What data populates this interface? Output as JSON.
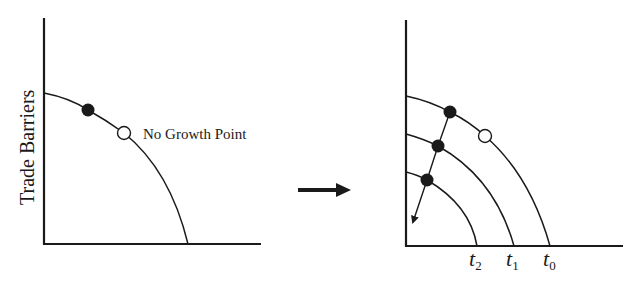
{
  "diagram": {
    "left_panel": {
      "y_axis_label": "Trade Barriers",
      "annotation": "No Growth Point",
      "points": [
        {
          "type": "filled",
          "label": "current point"
        },
        {
          "type": "open",
          "label": "No Growth Point"
        }
      ]
    },
    "transition_arrow": {
      "direction": "right"
    },
    "right_panel": {
      "curves": [
        {
          "label": "t",
          "sub": "0"
        },
        {
          "label": "t",
          "sub": "1"
        },
        {
          "label": "t",
          "sub": "2"
        }
      ],
      "points": [
        {
          "type": "filled",
          "curve": "t0"
        },
        {
          "type": "filled",
          "curve": "t1"
        },
        {
          "type": "filled",
          "curve": "t2"
        },
        {
          "type": "open",
          "curve": "t0"
        }
      ],
      "trend_arrow": {
        "direction": "down-left"
      }
    },
    "colors": {
      "ink": "#1a1a1a",
      "background": "#ffffff"
    }
  }
}
